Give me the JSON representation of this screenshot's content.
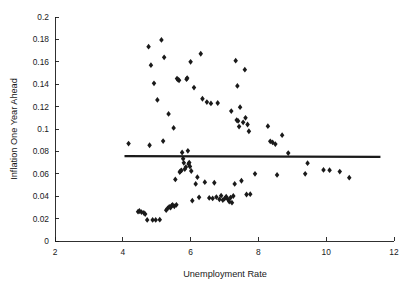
{
  "chart_data": {
    "type": "scatter",
    "title": "",
    "xlabel": "Unemployment Rate",
    "ylabel": "Inflation One Year Ahead",
    "xlim": [
      2,
      12
    ],
    "ylim": [
      0,
      0.2
    ],
    "xticks": [
      2,
      4,
      6,
      8,
      10,
      12
    ],
    "yticks": [
      0,
      0.02,
      0.04,
      0.06,
      0.08,
      0.1,
      0.12,
      0.14,
      0.16,
      0.18,
      0.2
    ],
    "xtick_labels": [
      "2",
      "4",
      "6",
      "8",
      "10",
      "12"
    ],
    "ytick_labels": [
      "0",
      "0.02",
      "0.04",
      "0.06",
      "0.08",
      "0.1",
      "0.12",
      "0.14",
      "0.16",
      "0.18",
      "0.2"
    ],
    "grid": false,
    "legend": null,
    "marker": "diamond",
    "marker_color": "#1a1a1a",
    "marker_size": 4.0,
    "series": [
      {
        "name": "Inflation vs Unemployment",
        "points": [
          [
            4.17,
            0.087
          ],
          [
            4.45,
            0.0262
          ],
          [
            4.49,
            0.0268
          ],
          [
            4.55,
            0.0258
          ],
          [
            4.62,
            0.0252
          ],
          [
            4.66,
            0.024
          ],
          [
            4.72,
            0.0188
          ],
          [
            4.76,
            0.1735
          ],
          [
            4.79,
            0.0855
          ],
          [
            4.83,
            0.157
          ],
          [
            4.88,
            0.0188
          ],
          [
            4.92,
            0.1408
          ],
          [
            4.97,
            0.0188
          ],
          [
            5.02,
            0.126
          ],
          [
            5.09,
            0.019
          ],
          [
            5.14,
            0.1795
          ],
          [
            5.19,
            0.0892
          ],
          [
            5.22,
            0.164
          ],
          [
            5.28,
            0.0275
          ],
          [
            5.32,
            0.0291
          ],
          [
            5.35,
            0.1135
          ],
          [
            5.37,
            0.0305
          ],
          [
            5.41,
            0.0299
          ],
          [
            5.44,
            0.0315
          ],
          [
            5.47,
            0.0322
          ],
          [
            5.5,
            0.101
          ],
          [
            5.52,
            0.031
          ],
          [
            5.55,
            0.055
          ],
          [
            5.58,
            0.0323
          ],
          [
            5.6,
            0.145
          ],
          [
            5.63,
            0.144
          ],
          [
            5.66,
            0.1435
          ],
          [
            5.68,
            0.0615
          ],
          [
            5.7,
            0.0624
          ],
          [
            5.73,
            0.063
          ],
          [
            5.75,
            0.079
          ],
          [
            5.78,
            0.0735
          ],
          [
            5.8,
            0.0698
          ],
          [
            5.83,
            0.0642
          ],
          [
            5.86,
            0.066
          ],
          [
            5.88,
            0.1445
          ],
          [
            5.9,
            0.1455
          ],
          [
            5.92,
            0.0805
          ],
          [
            5.94,
            0.0688
          ],
          [
            5.96,
            0.07
          ],
          [
            5.98,
            0.0665
          ],
          [
            6.0,
            0.16
          ],
          [
            6.02,
            0.0625
          ],
          [
            6.05,
            0.036
          ],
          [
            6.1,
            0.137
          ],
          [
            6.15,
            0.051
          ],
          [
            6.2,
            0.057
          ],
          [
            6.25,
            0.039
          ],
          [
            6.3,
            0.1672
          ],
          [
            6.35,
            0.127
          ],
          [
            6.42,
            0.0525
          ],
          [
            6.48,
            0.124
          ],
          [
            6.55,
            0.0385
          ],
          [
            6.6,
            0.1228
          ],
          [
            6.65,
            0.038
          ],
          [
            6.7,
            0.052
          ],
          [
            6.76,
            0.0392
          ],
          [
            6.8,
            0.1232
          ],
          [
            6.85,
            0.0372
          ],
          [
            6.9,
            0.0405
          ],
          [
            6.95,
            0.0365
          ],
          [
            7.0,
            0.0378
          ],
          [
            7.05,
            0.0395
          ],
          [
            7.1,
            0.0372
          ],
          [
            7.14,
            0.0352
          ],
          [
            7.18,
            0.0388
          ],
          [
            7.2,
            0.116
          ],
          [
            7.22,
            0.0342
          ],
          [
            7.26,
            0.0402
          ],
          [
            7.3,
            0.051
          ],
          [
            7.33,
            0.161
          ],
          [
            7.36,
            0.108
          ],
          [
            7.38,
            0.1385
          ],
          [
            7.4,
            0.1072
          ],
          [
            7.43,
            0.1022
          ],
          [
            7.46,
            0.1195
          ],
          [
            7.5,
            0.0538
          ],
          [
            7.55,
            0.106
          ],
          [
            7.6,
            0.153
          ],
          [
            7.62,
            0.11
          ],
          [
            7.65,
            0.0415
          ],
          [
            7.68,
            0.104
          ],
          [
            7.72,
            0.098
          ],
          [
            7.76,
            0.0418
          ],
          [
            7.9,
            0.06
          ],
          [
            8.28,
            0.1025
          ],
          [
            8.35,
            0.089
          ],
          [
            8.42,
            0.088
          ],
          [
            8.5,
            0.0865
          ],
          [
            8.55,
            0.059
          ],
          [
            8.7,
            0.0945
          ],
          [
            8.88,
            0.0785
          ],
          [
            9.38,
            0.06
          ],
          [
            9.45,
            0.0695
          ],
          [
            9.92,
            0.0635
          ],
          [
            10.1,
            0.0632
          ],
          [
            10.4,
            0.062
          ],
          [
            10.68,
            0.0565
          ]
        ]
      }
    ],
    "reference_line": {
      "name": "regression-fit",
      "x_start": 4.05,
      "x_end": 11.6,
      "y_start": 0.0757,
      "y_end": 0.0751,
      "color": "#1a1a1a",
      "width": 2.2
    }
  }
}
